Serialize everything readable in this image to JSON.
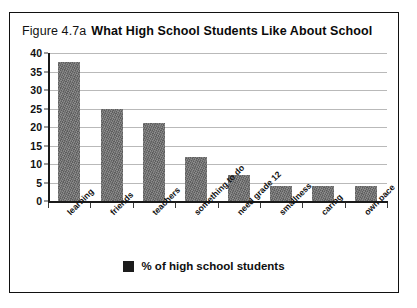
{
  "figure": {
    "number_label": "Figure 4.7a",
    "title": "What High School Students Like About School",
    "border_color": "#111111",
    "background_color": "#ffffff"
  },
  "legend": {
    "position": "bottom-center",
    "swatch_color": "#1c1c1c",
    "label": "% of high school students"
  },
  "chart_data": {
    "type": "bar",
    "title": "What High School Students Like About School",
    "subtitle": "Figure 4.7a",
    "xlabel": "",
    "ylabel": "",
    "ylim": [
      0,
      40
    ],
    "yticks": [
      0,
      5,
      10,
      15,
      20,
      25,
      30,
      35,
      40
    ],
    "ytick_labels": [
      "0",
      "5",
      "10",
      "15",
      "20",
      "25",
      "30",
      "35",
      "40"
    ],
    "grid": true,
    "grid_axis": "y",
    "legend_position": "bottom-center",
    "bar_color": "#6f6f6f",
    "categories": [
      "learning",
      "friends",
      "teachers",
      "something to do",
      "need grade 12",
      "smallness",
      "caring",
      "own pace"
    ],
    "series": [
      {
        "name": "% of high school students",
        "values": [
          37.5,
          25,
          21,
          12,
          7,
          4,
          4,
          4
        ]
      }
    ]
  }
}
